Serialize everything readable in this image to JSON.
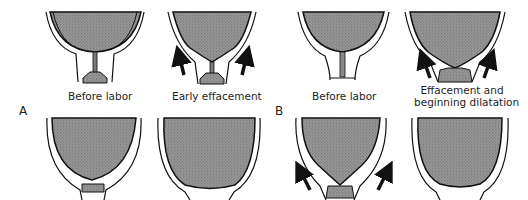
{
  "figure": {
    "sequences": [
      {
        "letter": "A",
        "top_panels": [
          {
            "label": "Before labor",
            "arrows": false
          },
          {
            "label": "Early effacement",
            "arrows": true
          }
        ],
        "bottom_panels": [
          {
            "stage": "effacement-progressing",
            "arrows": false
          },
          {
            "stage": "complete-effacement",
            "arrows": false
          }
        ]
      },
      {
        "letter": "B",
        "top_panels": [
          {
            "label": "Before labor",
            "arrows": false
          },
          {
            "label_line1": "Effacement and",
            "label_line2": "beginning dilatation",
            "arrows": true
          }
        ],
        "bottom_panels": [
          {
            "stage": "further-effacement-dilatation",
            "arrows": true
          },
          {
            "stage": "complete-effacement-dilatation",
            "arrows": false
          }
        ]
      }
    ],
    "colors": {
      "uterus_fill": "#8a8a8a",
      "outline": "#111111",
      "background": "#ffffff"
    }
  }
}
